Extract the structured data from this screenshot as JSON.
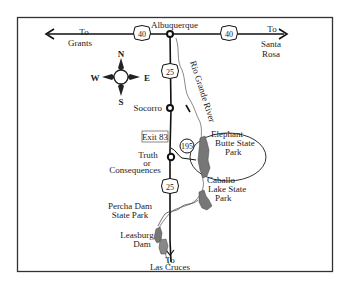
{
  "map": {
    "title": "Route map: Albuquerque to Las Cruces via I-25",
    "frame_color": "#333333",
    "road_color": "#111111",
    "lake_color": "#777777",
    "labels": {
      "albuquerque": "Albuquerque",
      "to_grants_1": "To",
      "to_grants_2": "Grants",
      "to_santa_rosa_1": "To",
      "to_santa_rosa_2": "Santa",
      "to_santa_rosa_3": "Rosa",
      "socorro": "Socorro",
      "exit": "Exit 83",
      "truth_1": "Truth",
      "truth_2": "or",
      "truth_3": "Consequences",
      "river": "Rio Grande River",
      "elephant_1": "Elephant",
      "elephant_2": "Butte State",
      "elephant_3": "Park",
      "caballo_1": "Caballo",
      "caballo_2": "Lake State",
      "caballo_3": "Park",
      "percha_1": "Percha Dam",
      "percha_2": "State Park",
      "leasburg_1": "Leasburg",
      "leasburg_2": "Dam",
      "to_las_cruces_1": "To",
      "to_las_cruces_2": "Las Cruces"
    },
    "shields": {
      "i40_west": "40",
      "i40_east": "40",
      "i25_north": "25",
      "i25_south": "25",
      "nm195": "195"
    },
    "compass": {
      "n": "N",
      "s": "S",
      "e": "E",
      "w": "W"
    }
  }
}
